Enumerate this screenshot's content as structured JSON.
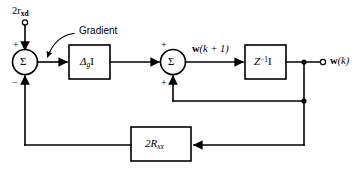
{
  "diagram": {
    "background_color": "#ffffff",
    "line_color": "#000000",
    "inputs": [
      {
        "name": "input-terminal-label",
        "text_parts": {
          "lead": "2r",
          "sub": "xd"
        },
        "terminal": "open-circle"
      }
    ],
    "outputs": [
      {
        "name": "output-terminal-label",
        "text_parts": {
          "lead": "w",
          "paren": "(k)"
        },
        "terminal": "open-circle"
      }
    ],
    "annotations": [
      {
        "name": "gradient-annotation",
        "label": "Gradient"
      }
    ],
    "summers": [
      {
        "name": "summer-left",
        "glyph": "Σ",
        "signs": {
          "top": "+",
          "bottom": "−"
        }
      },
      {
        "name": "summer-right",
        "glyph": "Σ",
        "signs": {
          "top": "+",
          "bottom": "+"
        }
      }
    ],
    "blocks": [
      {
        "name": "gradient-gain-block",
        "label_parts": {
          "lead": "Δ",
          "sub": "g",
          "tail": "I"
        }
      },
      {
        "name": "unit-delay-block",
        "label_parts": {
          "lead": "Z",
          "sup": "−1",
          "tail": "I"
        }
      },
      {
        "name": "correlation-matrix-block",
        "label_parts": {
          "lead": "2R",
          "sub": "xx"
        }
      }
    ],
    "signals": [
      {
        "name": "weight-update-signal-label",
        "text_parts": {
          "lead": "w",
          "paren": "(k + 1)"
        }
      }
    ]
  }
}
